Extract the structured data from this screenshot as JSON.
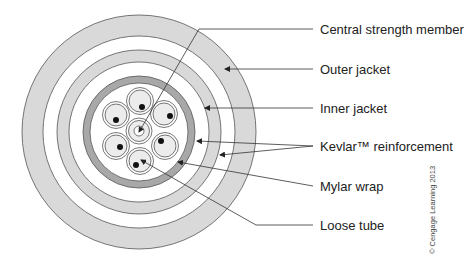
{
  "diagram": {
    "colors": {
      "jacket_fill": "#d9d9d9",
      "mylar_fill": "#a8a8a8",
      "tube_fill": "#ececec",
      "line": "#555555",
      "fiber": "#111111"
    },
    "labels": [
      {
        "id": "central-strength-member",
        "text": "Central strength member"
      },
      {
        "id": "outer-jacket",
        "text": "Outer jacket"
      },
      {
        "id": "inner-jacket",
        "text": "Inner jacket"
      },
      {
        "id": "kevlar-reinforcement",
        "text": "Kevlar™ reinforcement"
      },
      {
        "id": "mylar-wrap",
        "text": "Mylar wrap"
      },
      {
        "id": "loose-tube",
        "text": "Loose tube"
      }
    ],
    "copyright": "© Cengage Learning 2013"
  }
}
